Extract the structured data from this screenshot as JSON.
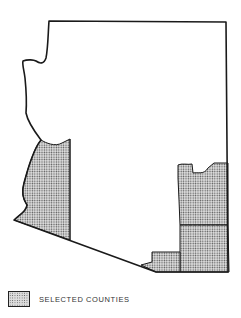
{
  "map": {
    "region": "state outline with selected counties",
    "colors": {
      "outline": "#1a1a1a",
      "selected_fill": "#c8c8c8",
      "background": "#ffffff"
    }
  },
  "legend": {
    "items": [
      {
        "label": "SELECTED COUNTIES",
        "pattern": "stippled"
      }
    ]
  }
}
